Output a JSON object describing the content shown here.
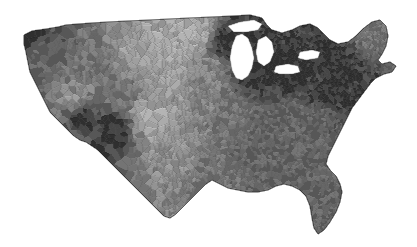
{
  "figure": {
    "kind": "choropleth-map",
    "region": "Contiguous United States",
    "unit": "county",
    "title": "",
    "subtitle": "",
    "legend": "",
    "axis_labels": "",
    "background_color": "#ffffff",
    "border_color": "#5a5a5a",
    "water_color": "#ffffff"
  },
  "chart_data": {
    "type": "heatmap",
    "title": "",
    "xlabel": "",
    "ylabel": "",
    "legend_position": "none",
    "grid": false,
    "projection": "albers-usa",
    "geography": "us-counties",
    "n_regions": 3109,
    "scale": "sequential-grayscale-reversed",
    "bin_colors": [
      "#ffffff",
      "#f0f0f0",
      "#dcdcdc",
      "#c4c4c4",
      "#a8a8a8",
      "#8e8e8e",
      "#747474",
      "#5a5a5a",
      "#3a3a3a",
      "#111111"
    ],
    "bin_labels": [
      "lowest",
      "very low",
      "low",
      "low-mid",
      "mid",
      "mid-high",
      "high",
      "very high",
      "near-highest",
      "highest"
    ],
    "value_range": [
      0,
      9
    ],
    "region_summary": [
      {
        "name": "Pacific Northwest coast (Puget Sound)",
        "bin": 9,
        "color": "#111111"
      },
      {
        "name": "Oregon / Washington interior",
        "bin": 6,
        "color": "#747474"
      },
      {
        "name": "Northern California coast",
        "bin": 6,
        "color": "#747474"
      },
      {
        "name": "Central California valley",
        "bin": 4,
        "color": "#a8a8a8"
      },
      {
        "name": "Nevada basin",
        "bin": 3,
        "color": "#c4c4c4"
      },
      {
        "name": "Southern Nevada / Clark",
        "bin": 9,
        "color": "#111111"
      },
      {
        "name": "Arizona south (Pima/Maricopa belt)",
        "bin": 9,
        "color": "#111111"
      },
      {
        "name": "Utah / Idaho plateau",
        "bin": 5,
        "color": "#8e8e8e"
      },
      {
        "name": "Colorado Front Range",
        "bin": 5,
        "color": "#8e8e8e"
      },
      {
        "name": "Great Plains (Dakotas, Nebraska, Kansas)",
        "bin": 1,
        "color": "#f0f0f0"
      },
      {
        "name": "West Texas plains",
        "bin": 1,
        "color": "#f0f0f0"
      },
      {
        "name": "Central Texas",
        "bin": 3,
        "color": "#c4c4c4"
      },
      {
        "name": "East Texas / Gulf",
        "bin": 5,
        "color": "#8e8e8e"
      },
      {
        "name": "Minneapolis-St. Paul",
        "bin": 9,
        "color": "#111111"
      },
      {
        "name": "Upper Midwest farm belt",
        "bin": 4,
        "color": "#a8a8a8"
      },
      {
        "name": "Chicago / Lake Michigan shore",
        "bin": 9,
        "color": "#111111"
      },
      {
        "name": "Detroit / southeast Michigan",
        "bin": 9,
        "color": "#111111"
      },
      {
        "name": "Ohio industrial corridor",
        "bin": 9,
        "color": "#111111"
      },
      {
        "name": "Northeast corridor (NY-NJ-PA-CT-MA)",
        "bin": 9,
        "color": "#111111"
      },
      {
        "name": "Maine interior",
        "bin": 5,
        "color": "#8e8e8e"
      },
      {
        "name": "Appalachia (KY, WV, TN)",
        "bin": 6,
        "color": "#747474"
      },
      {
        "name": "Carolina piedmont",
        "bin": 6,
        "color": "#747474"
      },
      {
        "name": "Deep South (MS, AL, GA)",
        "bin": 6,
        "color": "#747474"
      },
      {
        "name": "Florida peninsula",
        "bin": 6,
        "color": "#747474"
      },
      {
        "name": "Washington D.C. / Baltimore",
        "bin": 9,
        "color": "#111111"
      }
    ]
  }
}
